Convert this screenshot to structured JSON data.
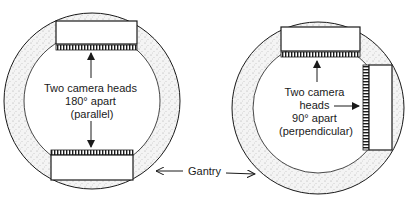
{
  "diagram": {
    "left": {
      "label_lines": [
        "Two camera heads",
        "180° apart",
        "(parallel)"
      ],
      "configuration": "parallel",
      "angle_deg": 180
    },
    "right": {
      "label_lines": [
        "Two camera",
        "heads",
        "90° apart",
        "(perpendicular)"
      ],
      "configuration": "perpendicular",
      "angle_deg": 90
    },
    "gantry_label": "Gantry"
  },
  "colors": {
    "stroke": "#1a1a1a",
    "gantry_fill": "#f2f2f2",
    "stipple": "#9a9a9a",
    "background": "#ffffff"
  }
}
